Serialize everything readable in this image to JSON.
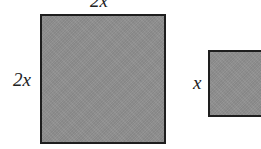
{
  "diagram": {
    "large_square": {
      "top_label": "2x",
      "side_label": "2x"
    },
    "small_square": {
      "side_label": "x"
    },
    "colors": {
      "fill": "#8f8f8f",
      "border": "#1e1e1e",
      "background": "#ffffff"
    }
  }
}
